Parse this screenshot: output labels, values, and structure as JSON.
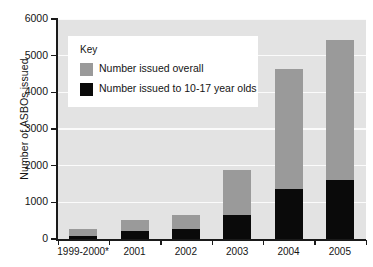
{
  "chart_data": {
    "type": "bar",
    "subtype": "stacked-overlay",
    "title": "",
    "xlabel": "",
    "ylabel": "Number of ASBOs issued",
    "categories": [
      "1999-2000*",
      "2001",
      "2002",
      "2003",
      "2004",
      "2005"
    ],
    "series": [
      {
        "name": "Number issued overall",
        "color": "#9a9a9a",
        "values": [
          273,
          518,
          650,
          1880,
          4640,
          5430
        ]
      },
      {
        "name": "Number issued to 10-17 year olds",
        "color": "#0a0a0a",
        "values": [
          82,
          218,
          270,
          650,
          1360,
          1610
        ]
      }
    ],
    "ylim": [
      0,
      6000
    ],
    "ytick_labels": [
      "0",
      "1000",
      "2000",
      "3000",
      "4000",
      "5000",
      "6000"
    ],
    "ytick_values": [
      0,
      1000,
      2000,
      3000,
      4000,
      5000,
      6000
    ],
    "grid": true,
    "grid_color": "#fbfbfb",
    "plot_background": "#e3e3e3",
    "legend_position": "upper-left-inside",
    "legend_title": "Key"
  },
  "axes": {
    "y_title": "Number of ASBOs issued"
  },
  "legend": {
    "title": "Key",
    "entries": [
      {
        "label": "Number issued overall",
        "color": "#9a9a9a"
      },
      {
        "label": "Number issued to 10-17 year olds",
        "color": "#0a0a0a"
      }
    ]
  }
}
